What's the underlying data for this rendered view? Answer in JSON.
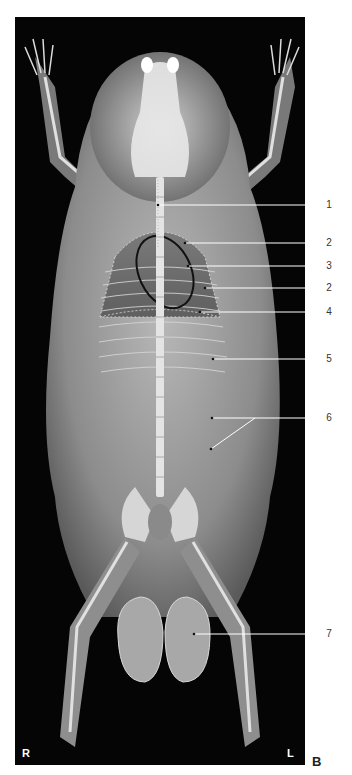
{
  "figure": {
    "panel_letter": "B",
    "orientation": {
      "right": "R",
      "left": "L"
    },
    "labels": [
      {
        "number": "1",
        "y": 205
      },
      {
        "number": "2",
        "y": 243
      },
      {
        "number": "3",
        "y": 266
      },
      {
        "number": "2",
        "y": 288
      },
      {
        "number": "4",
        "y": 312
      },
      {
        "number": "5",
        "y": 359
      },
      {
        "number": "6",
        "y": 418
      },
      {
        "number": "7",
        "y": 634
      }
    ],
    "colors": {
      "background": "#050505",
      "bone": "#f2f2f2",
      "soft_tissue": "#9a9a9a",
      "annotation_line": "#ffffff"
    }
  }
}
